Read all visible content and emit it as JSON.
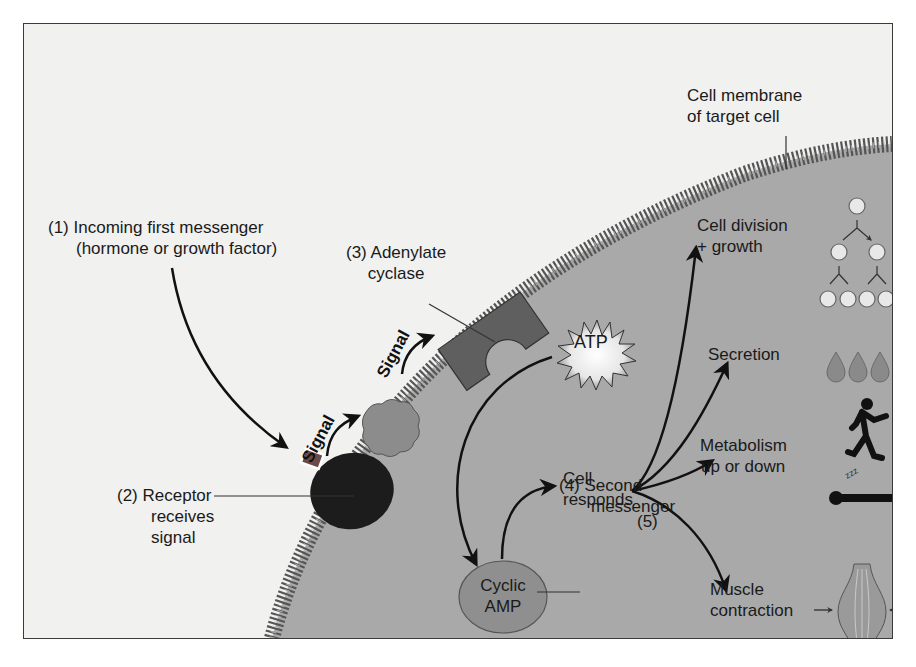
{
  "diagram": {
    "labels": {
      "step1_line1": "(1) Incoming first messenger",
      "step1_line2": "(hormone or growth factor)",
      "step2_line1": "(2) Receptor",
      "step2_line2": "receives",
      "step2_line3": "signal",
      "step3_line1": "(3) Adenylate",
      "step3_line2": "cyclase",
      "step4_line1": "(4) Second",
      "step4_line2": "messenger",
      "step5": "(5)",
      "membrane_line1": "Cell membrane",
      "membrane_line2": "of target cell",
      "signal_1": "Signal",
      "signal_2": "Signal",
      "atp": "ATP",
      "camp_line1": "Cyclic",
      "camp_line2": "AMP",
      "cell_responds_line1": "Cell",
      "cell_responds_line2": "responds"
    },
    "responses": [
      {
        "line1": "Cell division",
        "line2": "+ growth",
        "icon": "cell-division-icon"
      },
      {
        "line1": "Secretion",
        "line2": "",
        "icon": "droplets-icon"
      },
      {
        "line1": "Metabolism",
        "line2": "up or down",
        "icon": "runner-sleeper-icon"
      },
      {
        "line1": "Muscle",
        "line2": "contraction",
        "icon": "muscle-icon"
      }
    ],
    "colors": {
      "background": "#f1f1f0",
      "cell_interior": "#a9a9a9",
      "membrane": "#5a5a5a",
      "receptor": "#1c1c1c",
      "g_protein": "#8c8c8c",
      "adenylate_cyclase": "#5f5f5f",
      "camp": "#8f8f8f",
      "hormone": "#6a4a4a"
    }
  }
}
